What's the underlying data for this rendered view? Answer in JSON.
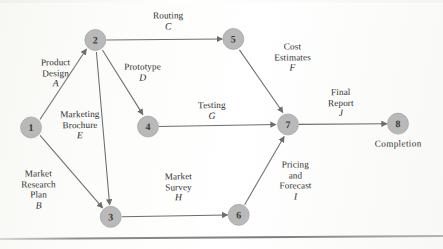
{
  "figure": {
    "type": "activity-on-arrow-network",
    "node_fill_color": "#b9b9b9",
    "edge_color": "#6d6d6d",
    "background_color": "#fdfdfb"
  },
  "nodes": [
    {
      "id": "1",
      "label": "1",
      "x": 31,
      "y": 126
    },
    {
      "id": "2",
      "label": "2",
      "x": 96,
      "y": 39
    },
    {
      "id": "3",
      "label": "3",
      "x": 110,
      "y": 216
    },
    {
      "id": "4",
      "label": "4",
      "x": 148,
      "y": 126
    },
    {
      "id": "5",
      "label": "5",
      "x": 234,
      "y": 39
    },
    {
      "id": "6",
      "label": "6",
      "x": 238,
      "y": 215
    },
    {
      "id": "7",
      "label": "7",
      "x": 288,
      "y": 125
    },
    {
      "id": "8",
      "label": "8",
      "x": 398,
      "y": 125
    }
  ],
  "edges": [
    {
      "code": "A",
      "name": "Product Design",
      "from": "1",
      "to": "2"
    },
    {
      "code": "B",
      "name": "Market Research Plan",
      "from": "1",
      "to": "3"
    },
    {
      "code": "C",
      "name": "Routing",
      "from": "2",
      "to": "5"
    },
    {
      "code": "D",
      "name": "Prototype",
      "from": "2",
      "to": "4"
    },
    {
      "code": "E",
      "name": "Marketing Brochure",
      "from": "2",
      "to": "3"
    },
    {
      "code": "F",
      "name": "Cost Estimates",
      "from": "5",
      "to": "7"
    },
    {
      "code": "G",
      "name": "Testing",
      "from": "4",
      "to": "7"
    },
    {
      "code": "H",
      "name": "Market Survey",
      "from": "3",
      "to": "6"
    },
    {
      "code": "I",
      "name": "Pricing and Forecast",
      "from": "6",
      "to": "7"
    },
    {
      "code": "J",
      "name": "Final Report",
      "from": "7",
      "to": "8"
    }
  ],
  "labels": {
    "a": {
      "line1": "Product",
      "line2": "Design",
      "code": "A"
    },
    "b": {
      "line1": "Market",
      "line2": "Research",
      "line3": "Plan",
      "code": "B"
    },
    "c": {
      "line1": "Routing",
      "code": "C"
    },
    "d": {
      "line1": "Prototype",
      "code": "D"
    },
    "e": {
      "line1": "Marketing",
      "line2": "Brochure",
      "code": "E"
    },
    "f": {
      "line1": "Cost",
      "line2": "Estimates",
      "code": "F"
    },
    "g": {
      "line1": "Testing",
      "code": "G"
    },
    "h": {
      "line1": "Market",
      "line2": "Survey",
      "code": "H"
    },
    "i": {
      "line1": "Pricing",
      "line2": "and",
      "line3": "Forecast",
      "code": "I"
    },
    "j": {
      "line1": "Final",
      "line2": "Report",
      "code": "J"
    },
    "completion": "Completion"
  }
}
